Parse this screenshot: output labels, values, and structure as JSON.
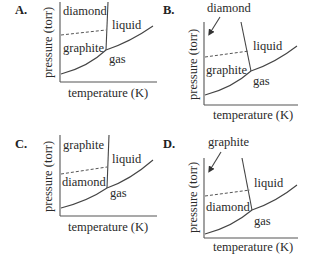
{
  "panels": [
    {
      "letter": "A.",
      "ylabel": "pressure (torr)",
      "xlabel": "temperature (K)",
      "regions": {
        "top_left": "diamond",
        "bottom_left": "graphite",
        "right": "liquid",
        "bottom": "gas"
      },
      "arrow_label": null
    },
    {
      "letter": "B.",
      "ylabel": "pressure (torr)",
      "xlabel": "temperature (K)",
      "regions": {
        "bottom_left": "graphite",
        "right": "liquid",
        "bottom": "gas"
      },
      "arrow_label": "diamond"
    },
    {
      "letter": "C.",
      "ylabel": "pressure (torr)",
      "xlabel": "temperature (K)",
      "regions": {
        "top_left": "graphite",
        "bottom_left": "diamond",
        "right": "liquid",
        "bottom": "gas"
      },
      "arrow_label": null
    },
    {
      "letter": "D.",
      "ylabel": "pressure (torr)",
      "xlabel": "temperature (K)",
      "regions": {
        "bottom_left": "diamond",
        "right": "liquid",
        "bottom": "gas"
      },
      "arrow_label": "graphite"
    }
  ]
}
